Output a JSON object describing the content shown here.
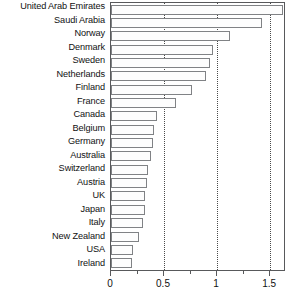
{
  "chart_data": {
    "type": "bar",
    "orientation": "horizontal",
    "title": "",
    "subtitle": "",
    "xlabel": "",
    "ylabel": "",
    "xlim": [
      0,
      1.65
    ],
    "ylim": null,
    "grid": true,
    "grid_axis": "x",
    "grid_style": "dotted",
    "legend": false,
    "legend_position": "none",
    "xticks": [
      0,
      0.5,
      1,
      1.5
    ],
    "xtick_labels": [
      "0",
      "0.5",
      "1",
      "1.5"
    ],
    "x_minor_ticks": [
      0.25,
      0.75,
      1.25
    ],
    "categories": [
      "United Arab Emirates",
      "Saudi Arabia",
      "Norway",
      "Denmark",
      "Sweden",
      "Netherlands",
      "Finland",
      "France",
      "Canada",
      "Belgium",
      "Germany",
      "Australia",
      "Switzerland",
      "Austria",
      "UK",
      "Japan",
      "Italy",
      "New Zealand",
      "USA",
      "Ireland"
    ],
    "values": [
      1.62,
      1.42,
      1.12,
      0.96,
      0.93,
      0.9,
      0.76,
      0.61,
      0.43,
      0.41,
      0.4,
      0.38,
      0.35,
      0.34,
      0.32,
      0.32,
      0.3,
      0.26,
      0.21,
      0.2
    ]
  },
  "style": {
    "bar_fill": "#fdfdfd",
    "bar_border": "#808285",
    "axis_color": "#58595b",
    "grid_color": "#4a4a4a",
    "text_color": "#111111",
    "background": "#ffffff"
  }
}
